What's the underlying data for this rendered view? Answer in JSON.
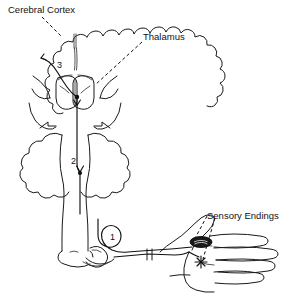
{
  "figure": {
    "background_color": "#ffffff",
    "line_color": "#111111",
    "width": 296,
    "height": 303
  },
  "labels": {
    "cerebral_cortex": "Cerebral Cortex",
    "thalamus": "Thalamus",
    "sensory_endings": "Sensory Endings"
  },
  "neuron_numbers": {
    "first_order": "1",
    "second_order": "2",
    "third_order": "3"
  },
  "structures": {
    "cerebrum": "cerebrum-outline",
    "cerebellum": "cerebellum-outline",
    "brainstem": "brainstem-outline",
    "spinal_cord": "spinal-cord-outline",
    "thalamus_body": "thalamus-outline",
    "hand": "hand-outline",
    "pacinian_corpuscle": "pacinian-corpuscle-icon",
    "free_nerve_ending": "free-nerve-ending-icon",
    "nerve_break": "nerve-break-marker"
  }
}
